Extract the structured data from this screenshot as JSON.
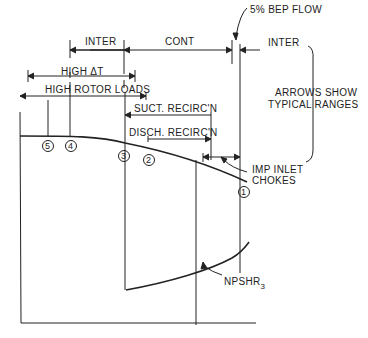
{
  "diagram": {
    "labels": {
      "bep_flow": "5% BEP FLOW",
      "inter_left": "INTER",
      "cont": "CONT",
      "inter_right": "INTER",
      "high_dt": "HIGH ΔT",
      "high_rotor_loads": "HIGH ROTOR LOADS",
      "suct_recirc": "SUCT. RECIRC'N",
      "disch_recirc": "DISCH. RECIRC'N",
      "imp_inlet_1": "IMP INLET",
      "imp_inlet_2": "CHOKES",
      "arrows_1": "ARROWS SHOW",
      "arrows_2": "TYPICAL RANGES",
      "npshr": "NPSHR",
      "npshr_sub": "3"
    },
    "points": [
      "5",
      "4",
      "3",
      "2",
      "1"
    ]
  }
}
